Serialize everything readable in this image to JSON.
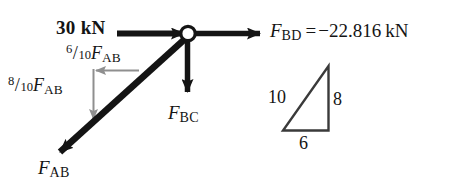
{
  "figure": {
    "type": "free-body-diagram",
    "ink_color": "#141414",
    "component_arrow_color": "#8c8c8c",
    "background_color": "#ffffff"
  },
  "joint": {
    "name": "pin-joint",
    "x": 188,
    "y": 34,
    "radius": 7,
    "fill": "#ffffff",
    "stroke": "#141414"
  },
  "forces": {
    "applied_load": {
      "label": "30 kN",
      "magnitude": 30,
      "unit": "kN",
      "direction": "right",
      "bold": true
    },
    "f_bd": {
      "symbol": "F",
      "subscript": "BD",
      "equals": "=",
      "value": "−22.816",
      "unit": "kN",
      "full_label": "F_BD = −22.816 kN",
      "direction": "right"
    },
    "f_bc": {
      "symbol": "F",
      "subscript": "BC",
      "full_label": "F_BC",
      "direction": "down"
    },
    "f_ab": {
      "symbol": "F",
      "subscript": "AB",
      "full_label": "F_AB",
      "direction": "down-left"
    },
    "f_ab_x_component": {
      "numerator": "6",
      "denominator": "10",
      "symbol": "F",
      "subscript": "AB",
      "full_label": "6/10 F_AB",
      "direction": "left"
    },
    "f_ab_y_component": {
      "numerator": "8",
      "denominator": "10",
      "symbol": "F",
      "subscript": "AB",
      "full_label": "8/10 F_AB",
      "direction": "down"
    }
  },
  "slope_triangle": {
    "name": "slope-reference-triangle",
    "hypotenuse": "10",
    "vertical": "8",
    "base": "6"
  }
}
